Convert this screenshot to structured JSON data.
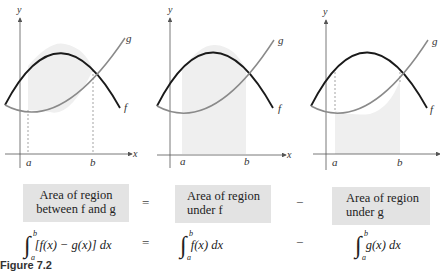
{
  "panels": [
    {
      "id": "between",
      "axis_labels": {
        "x": "x",
        "y": "y"
      },
      "tick_labels": {
        "a": "a",
        "b": "b"
      },
      "curve_labels": {
        "f": "f",
        "g": "g"
      },
      "shading": "between f and g from a to b"
    },
    {
      "id": "under-f",
      "axis_labels": {
        "x": "x",
        "y": "y"
      },
      "tick_labels": {
        "a": "a",
        "b": "b"
      },
      "curve_labels": {
        "f": "f",
        "g": "g"
      },
      "shading": "under f from a to b"
    },
    {
      "id": "under-g",
      "axis_labels": {
        "x": "x",
        "y": "y"
      },
      "tick_labels": {
        "a": "a",
        "b": "b"
      },
      "curve_labels": {
        "f": "f",
        "g": "g"
      },
      "shading": "under g from a to b"
    }
  ],
  "boxes": {
    "between": {
      "line1": "Area of region",
      "line2": "between f and g"
    },
    "under_f": {
      "line1": "Area of region",
      "line2": "under f"
    },
    "under_g": {
      "line1": "Area of region",
      "line2": "under g"
    }
  },
  "operators": {
    "equals": "=",
    "minus": "−"
  },
  "formulas": {
    "integral_sign": "∫",
    "upper": "b",
    "lower": "a",
    "between": "[f(x) − g(x)] dx",
    "under_f": "f(x) dx",
    "under_g": "g(x) dx"
  },
  "caption": "Figure 7.2",
  "colors": {
    "curve_f": "#1a1a1a",
    "curve_g": "#8a8a8a",
    "shading": "#efefef",
    "box_bg": "#e3e3e3",
    "axis": "#555555"
  }
}
